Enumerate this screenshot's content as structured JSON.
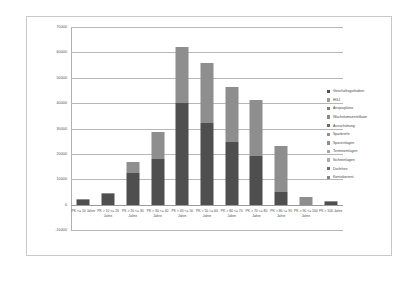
{
  "chart_data": {
    "type": "bar",
    "subtype": "stacked-column",
    "title": "",
    "xlabel": "",
    "ylabel": "",
    "ylim": [
      -10000,
      70000
    ],
    "ytick_values": [
      -10000,
      0,
      10000,
      20000,
      30000,
      40000,
      50000,
      60000,
      70000
    ],
    "ytick_labels": [
      "-10000",
      "0",
      "10000",
      "20000",
      "30000",
      "40000",
      "50000",
      "60000",
      "70000"
    ],
    "grid": true,
    "legend_position": "right",
    "categories": [
      "PK <= 10 Jahre",
      "PK > 10 <= 20 Jahre",
      "PK > 20 <= 30 Jahre",
      "PK > 30 <= 40 Jahre",
      "PK > 40 <= 50 Jahre",
      "PK > 50 <= 60 Jahre",
      "PK > 60 <= 70 Jahre",
      "PK > 70 <= 80 Jahre",
      "PK > 80 <= 90 Jahre",
      "PK > 90 <= 100 Jahre",
      "PK > 100 Jahre"
    ],
    "series": [
      {
        "name": "Geschäftsguthaben",
        "color": "#4f4f4f",
        "values": [
          1700,
          4000,
          12600,
          17800,
          40100,
          32300,
          24600,
          19300,
          4900,
          0,
          900
        ]
      },
      {
        "name": "HGJ",
        "color": "#9d9d9d",
        "values": [
          0,
          0,
          0,
          0,
          0,
          0,
          0,
          0,
          0,
          0,
          0
        ]
      },
      {
        "name": "Ansparpläne",
        "color": "#7d7d7d",
        "values": [
          0,
          0,
          0,
          0,
          0,
          0,
          0,
          0,
          0,
          0,
          0
        ]
      },
      {
        "name": "Wachstumszertifikate",
        "color": "#8a8a8a",
        "values": [
          0,
          0,
          0,
          0,
          0,
          0,
          0,
          0,
          0,
          0,
          0
        ]
      },
      {
        "name": "Ausschüttung",
        "color": "#6a6a6a",
        "values": [
          0,
          0,
          0,
          0,
          0,
          0,
          0,
          0,
          0,
          0,
          0
        ]
      },
      {
        "name": "Sparbriefe",
        "color": "#919191",
        "values": [
          0,
          0,
          0,
          0,
          0,
          0,
          0,
          0,
          0,
          0,
          0
        ]
      },
      {
        "name": "Spareinlagen",
        "color": "#8e8e8e",
        "values": [
          500,
          700,
          4200,
          11000,
          22200,
          23400,
          21800,
          22000,
          18200,
          3200,
          500
        ]
      },
      {
        "name": "Termineinlagen",
        "color": "#a5a5a5",
        "values": [
          0,
          0,
          0,
          0,
          0,
          0,
          0,
          0,
          0,
          0,
          0
        ]
      },
      {
        "name": "Sichteinlagen",
        "color": "#adadad",
        "values": [
          0,
          0,
          0,
          0,
          0,
          0,
          0,
          0,
          0,
          0,
          0
        ]
      },
      {
        "name": "Darlehen",
        "color": "#6f6f6f",
        "values": [
          0,
          0,
          0,
          0,
          0,
          0,
          0,
          0,
          0,
          0,
          0
        ]
      },
      {
        "name": "Kontokorrent",
        "color": "#848484",
        "values": [
          0,
          0,
          0,
          0,
          0,
          0,
          0,
          0,
          0,
          0,
          0
        ]
      }
    ],
    "totals": [
      2200,
      4700,
      16800,
      28800,
      62300,
      55700,
      46400,
      41300,
      23100,
      3200,
      1400
    ]
  }
}
